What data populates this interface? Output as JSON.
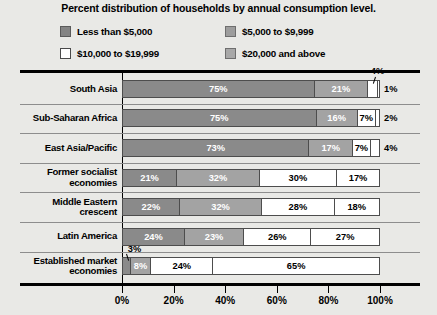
{
  "chart_data": {
    "type": "bar",
    "orientation": "horizontal",
    "stacked": true,
    "normalized": true,
    "title": "Percent distribution of households by annual consumption level.",
    "xlabel": "",
    "ylabel": "",
    "xlim": [
      0,
      100
    ],
    "xticks": [
      "0%",
      "20%",
      "40%",
      "60%",
      "80%",
      "100%"
    ],
    "xtick_values": [
      0,
      20,
      40,
      60,
      80,
      100
    ],
    "grid": false,
    "legend_position": "top",
    "categories": [
      "South Asia",
      "Sub-Saharan Africa",
      "East Asia/Pacific",
      "Former socialist economies",
      "Middle Eastern crescent",
      "Latin America",
      "Established market economies"
    ],
    "series": [
      {
        "name": "Less than $5,000",
        "color": "#8a8a8a",
        "values": [
          75,
          75,
          73,
          21,
          22,
          24,
          3
        ]
      },
      {
        "name": "$5,000 to $9,999",
        "color": "#a3a3a3",
        "values": [
          21,
          16,
          17,
          32,
          32,
          23,
          8
        ]
      },
      {
        "name": "$10,000 to $19,999",
        "color": "#ffffff",
        "values": [
          4,
          7,
          7,
          30,
          28,
          26,
          24
        ]
      },
      {
        "name": "$20,000 and above",
        "color": "#ffffff",
        "values": [
          1,
          2,
          4,
          17,
          18,
          27,
          65
        ]
      }
    ],
    "annotations": [
      {
        "text": "4%",
        "category": "South Asia",
        "series": "$10,000 to $19,999",
        "placement": "above-callout"
      },
      {
        "text": "3%",
        "category": "Established market economies",
        "series": "Less than $5,000",
        "placement": "above-callout"
      }
    ]
  },
  "legend": {
    "items": [
      {
        "label": "Less than $5,000",
        "swatch": "swatch-dark"
      },
      {
        "label": "$5,000 to $9,999",
        "swatch": "swatch-mid"
      },
      {
        "label": "$10,000 to $19,999",
        "swatch": "swatch-light"
      },
      {
        "label": "$20,000 and above",
        "swatch": "swatch-mid2"
      }
    ]
  },
  "rows": [
    {
      "label": "South Asia",
      "segments": [
        {
          "value": 75,
          "label": "75%",
          "style": "c0",
          "inside": true
        },
        {
          "value": 21,
          "label": "21%",
          "style": "c1",
          "inside": true
        },
        {
          "value": 4,
          "label": "",
          "style": "c2",
          "inside": false
        },
        {
          "value": 1,
          "label": "",
          "style": "c3",
          "inside": false
        }
      ],
      "outside_label": "1%",
      "callout": "4%"
    },
    {
      "label": "Sub-Saharan Africa",
      "segments": [
        {
          "value": 75,
          "label": "75%",
          "style": "c0",
          "inside": true
        },
        {
          "value": 16,
          "label": "16%",
          "style": "c1",
          "inside": true
        },
        {
          "value": 7,
          "label": "7%",
          "style": "c2",
          "inside": true
        },
        {
          "value": 2,
          "label": "",
          "style": "c3",
          "inside": false
        }
      ],
      "outside_label": "2%",
      "callout": ""
    },
    {
      "label": "East Asia/Pacific",
      "segments": [
        {
          "value": 73,
          "label": "73%",
          "style": "c0",
          "inside": true
        },
        {
          "value": 17,
          "label": "17%",
          "style": "c1",
          "inside": true
        },
        {
          "value": 7,
          "label": "7%",
          "style": "c2",
          "inside": true
        },
        {
          "value": 4,
          "label": "",
          "style": "c3",
          "inside": false
        }
      ],
      "outside_label": "4%",
      "callout": ""
    },
    {
      "label": "Former socialist\neconomies",
      "segments": [
        {
          "value": 21,
          "label": "21%",
          "style": "c0",
          "inside": true
        },
        {
          "value": 32,
          "label": "32%",
          "style": "c1",
          "inside": true
        },
        {
          "value": 30,
          "label": "30%",
          "style": "c2",
          "inside": true
        },
        {
          "value": 17,
          "label": "17%",
          "style": "c3",
          "inside": true
        }
      ],
      "outside_label": "",
      "callout": ""
    },
    {
      "label": "Middle Eastern\ncrescent",
      "segments": [
        {
          "value": 22,
          "label": "22%",
          "style": "c0",
          "inside": true
        },
        {
          "value": 32,
          "label": "32%",
          "style": "c1",
          "inside": true
        },
        {
          "value": 28,
          "label": "28%",
          "style": "c2",
          "inside": true
        },
        {
          "value": 18,
          "label": "18%",
          "style": "c3",
          "inside": true
        }
      ],
      "outside_label": "",
      "callout": ""
    },
    {
      "label": "Latin America",
      "segments": [
        {
          "value": 24,
          "label": "24%",
          "style": "c0",
          "inside": true
        },
        {
          "value": 23,
          "label": "23%",
          "style": "c1",
          "inside": true
        },
        {
          "value": 26,
          "label": "26%",
          "style": "c2",
          "inside": true
        },
        {
          "value": 27,
          "label": "27%",
          "style": "c3",
          "inside": true
        }
      ],
      "outside_label": "",
      "callout": ""
    },
    {
      "label": "Established market\neconomies",
      "segments": [
        {
          "value": 3,
          "label": "",
          "style": "c0",
          "inside": false
        },
        {
          "value": 8,
          "label": "8%",
          "style": "c1",
          "inside": true
        },
        {
          "value": 24,
          "label": "24%",
          "style": "c2",
          "inside": true
        },
        {
          "value": 65,
          "label": "65%",
          "style": "c3",
          "inside": true
        }
      ],
      "outside_label": "",
      "callout": "3%"
    }
  ],
  "axis": {
    "ticks": [
      "0%",
      "20%",
      "40%",
      "60%",
      "80%",
      "100%"
    ]
  }
}
